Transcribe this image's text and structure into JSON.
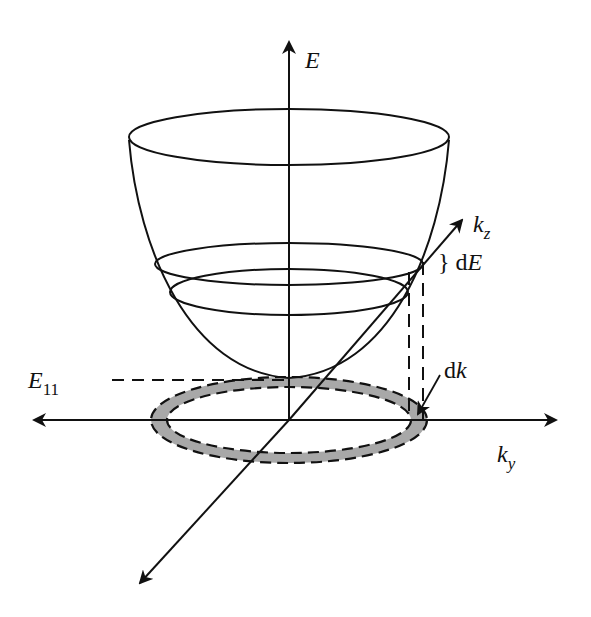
{
  "figure": {
    "type": "band-structure-paraboloid",
    "axes": {
      "energy": {
        "label": "E"
      },
      "kz": {
        "label": "k",
        "subscript": "z"
      },
      "ky": {
        "label": "k",
        "subscript": "y"
      }
    },
    "annotations": {
      "subband_edge": {
        "label": "E",
        "subscript": "11"
      },
      "energy_interval": {
        "brace": "}",
        "label_prefix": "d",
        "label_var": "E"
      },
      "k_interval": {
        "label_prefix": "d",
        "label_var": "k"
      }
    },
    "colors": {
      "line": "#111111",
      "ring_fill": "#a8a8a8",
      "background": "#ffffff"
    }
  }
}
